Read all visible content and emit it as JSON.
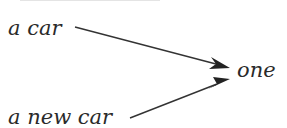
{
  "diagram": {
    "sources": [
      {
        "label": "a car"
      },
      {
        "label": "a new car"
      }
    ],
    "target": {
      "label": "one"
    },
    "edges": [
      {
        "from": "a car",
        "to": "one"
      },
      {
        "from": "a new car",
        "to": "one"
      }
    ],
    "colors": {
      "text": "#2a2a2a",
      "arrow": "#333333",
      "background": "#ffffff"
    }
  }
}
